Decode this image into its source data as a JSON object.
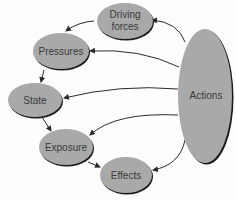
{
  "diagram": {
    "colors": {
      "node_fill": "#a9a9a9",
      "node_shadow": "#1a1a1a",
      "arrow": "#2b2b2b",
      "text": "#3a3a3a"
    },
    "nodes": {
      "driving_forces": {
        "line1": "Driving",
        "line2": "forces"
      },
      "pressures": {
        "label": "Pressures"
      },
      "state": {
        "label": "State"
      },
      "exposure": {
        "label": "Exposure"
      },
      "effects": {
        "label": "Effects"
      },
      "actions": {
        "label": "Actions"
      }
    },
    "edges": [
      {
        "from": "Driving forces",
        "to": "Pressures"
      },
      {
        "from": "Pressures",
        "to": "State"
      },
      {
        "from": "State",
        "to": "Exposure"
      },
      {
        "from": "Exposure",
        "to": "Effects"
      },
      {
        "from": "Actions",
        "to": "Driving forces"
      },
      {
        "from": "Actions",
        "to": "Pressures"
      },
      {
        "from": "Actions",
        "to": "State"
      },
      {
        "from": "Actions",
        "to": "Exposure"
      },
      {
        "from": "Actions",
        "to": "Effects"
      }
    ]
  }
}
